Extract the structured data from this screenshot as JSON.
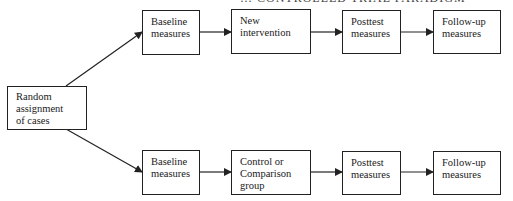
{
  "title_partial": "… CONTROLLED TRIAL PARADIGM",
  "start": {
    "label": "Random\nassignment\nof cases"
  },
  "arms": [
    {
      "name": "intervention",
      "steps": [
        {
          "label": "Baseline\nmeasures"
        },
        {
          "label": "New\nintervention"
        },
        {
          "label": "Posttest\nmeasures"
        },
        {
          "label": "Follow-up\nmeasures"
        }
      ]
    },
    {
      "name": "control",
      "steps": [
        {
          "label": "Baseline\nmeasures"
        },
        {
          "label": "Control or\nComparison\ngroup"
        },
        {
          "label": "Posttest\nmeasures"
        },
        {
          "label": "Follow-up\nmeasures"
        }
      ]
    }
  ],
  "colors": {
    "stroke": "#222222",
    "background": "#ffffff"
  }
}
